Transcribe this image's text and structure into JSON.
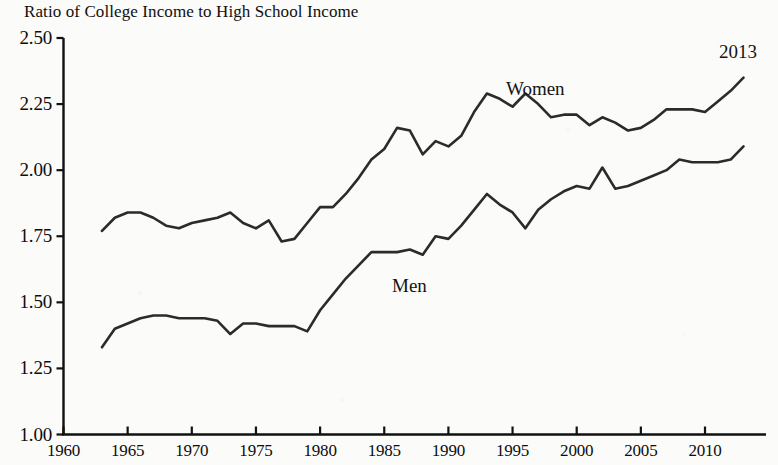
{
  "figure": {
    "title": "Ratio of College Income to High School Income",
    "clipped_top_text": "",
    "end_year_annotation": "2013"
  },
  "axes": {
    "y_ticks": [
      "1.00",
      "1.25",
      "1.50",
      "1.75",
      "2.00",
      "2.25",
      "2.50"
    ],
    "x_ticks": [
      "1960",
      "1965",
      "1970",
      "1975",
      "1980",
      "1985",
      "1990",
      "1995",
      "2000",
      "2005",
      "2010"
    ]
  },
  "labels": {
    "women": "Women",
    "men": "Men"
  },
  "colors": {
    "line": "#2b2b2b",
    "axis": "#111111",
    "background": "#fbfbfa"
  },
  "chart_data": {
    "type": "line",
    "title": "Ratio of College Income to High School Income",
    "xlabel": "",
    "ylabel": "Ratio of College Income to High School Income",
    "xlim": [
      1960,
      2014
    ],
    "ylim": [
      1.0,
      2.5
    ],
    "ytick_values": [
      1.0,
      1.25,
      1.5,
      1.75,
      2.0,
      2.25,
      2.5
    ],
    "xtick_values": [
      1960,
      1965,
      1970,
      1975,
      1980,
      1985,
      1990,
      1995,
      2000,
      2005,
      2010
    ],
    "grid": false,
    "legend": "inline-annotations",
    "annotations": [
      {
        "text": "Women",
        "x": 1995,
        "y": 2.27
      },
      {
        "text": "Men",
        "x": 1986,
        "y": 1.54
      },
      {
        "text": "2013",
        "x": 2012,
        "y": 2.45
      }
    ],
    "x": [
      1963,
      1964,
      1965,
      1966,
      1967,
      1968,
      1969,
      1970,
      1971,
      1972,
      1973,
      1974,
      1975,
      1976,
      1977,
      1978,
      1979,
      1980,
      1981,
      1982,
      1983,
      1984,
      1985,
      1986,
      1987,
      1988,
      1989,
      1990,
      1991,
      1992,
      1993,
      1994,
      1995,
      1996,
      1997,
      1998,
      1999,
      2000,
      2001,
      2002,
      2003,
      2004,
      2005,
      2006,
      2007,
      2008,
      2009,
      2010,
      2011,
      2012,
      2013
    ],
    "series": [
      {
        "name": "Women",
        "values": [
          1.77,
          1.82,
          1.84,
          1.84,
          1.82,
          1.79,
          1.78,
          1.8,
          1.81,
          1.82,
          1.84,
          1.8,
          1.78,
          1.81,
          1.73,
          1.74,
          1.8,
          1.86,
          1.86,
          1.91,
          1.97,
          2.04,
          2.08,
          2.16,
          2.15,
          2.06,
          2.11,
          2.09,
          2.13,
          2.22,
          2.29,
          2.27,
          2.24,
          2.29,
          2.25,
          2.2,
          2.21,
          2.21,
          2.17,
          2.2,
          2.18,
          2.15,
          2.16,
          2.19,
          2.23,
          2.23,
          2.23,
          2.22,
          2.26,
          2.3,
          2.35
        ]
      },
      {
        "name": "Men",
        "values": [
          1.33,
          1.4,
          1.42,
          1.44,
          1.45,
          1.45,
          1.44,
          1.44,
          1.44,
          1.43,
          1.38,
          1.42,
          1.42,
          1.41,
          1.41,
          1.41,
          1.39,
          1.47,
          1.53,
          1.59,
          1.64,
          1.69,
          1.69,
          1.69,
          1.7,
          1.68,
          1.75,
          1.74,
          1.79,
          1.85,
          1.91,
          1.87,
          1.84,
          1.78,
          1.85,
          1.89,
          1.92,
          1.94,
          1.93,
          2.01,
          1.93,
          1.94,
          1.96,
          1.98,
          2.0,
          2.04,
          2.03,
          2.03,
          2.03,
          2.04,
          2.09
        ]
      }
    ]
  }
}
